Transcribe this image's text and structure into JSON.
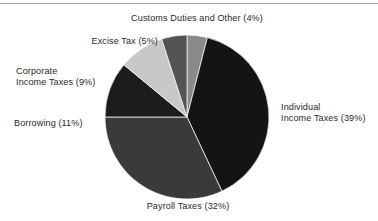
{
  "figure": {
    "background_color": "#ffffff",
    "header_rule_color": "#a9a9a9",
    "label_text_color": "#2b2b2b"
  },
  "chart_data": {
    "type": "pie",
    "title": "",
    "subtitle": "",
    "xlabel": "",
    "ylabel": "",
    "legend_position": "none",
    "grid": false,
    "units": "percent",
    "start_angle_deg": 0,
    "direction": "clockwise",
    "center": {
      "x": 187,
      "y": 117
    },
    "radius": 82,
    "categories": [
      "Customs Duties and Other",
      "Individual Income Taxes",
      "Payroll Taxes",
      "Borrowing",
      "Corporate Income Taxes",
      "Excise Tax"
    ],
    "values": [
      4,
      39,
      32,
      11,
      9,
      5
    ],
    "colors": [
      "#8a8a8a",
      "#141414",
      "#3a3a3a",
      "#1c1c1c",
      "#c8c8c8",
      "#545454"
    ],
    "slices": [
      {
        "name": "Customs Duties and Other",
        "value": 4,
        "color": "#8a8a8a",
        "label_line_1": "Customs Duties and Other (4%)",
        "label_line_2": ""
      },
      {
        "name": "Individual Income Taxes",
        "value": 39,
        "color": "#141414",
        "label_line_1": "Individual",
        "label_line_2": "Income Taxes (39%)"
      },
      {
        "name": "Payroll Taxes",
        "value": 32,
        "color": "#3a3a3a",
        "label_line_1": "Payroll Taxes (32%)",
        "label_line_2": ""
      },
      {
        "name": "Borrowing",
        "value": 11,
        "color": "#1c1c1c",
        "label_line_1": "Borrowing (11%)",
        "label_line_2": ""
      },
      {
        "name": "Corporate Income Taxes",
        "value": 9,
        "color": "#c8c8c8",
        "label_line_1": "Corporate",
        "label_line_2": "Income Taxes (9%)"
      },
      {
        "name": "Excise Tax",
        "value": 5,
        "color": "#545454",
        "label_line_1": "Excise Tax (5%)",
        "label_line_2": ""
      }
    ]
  }
}
